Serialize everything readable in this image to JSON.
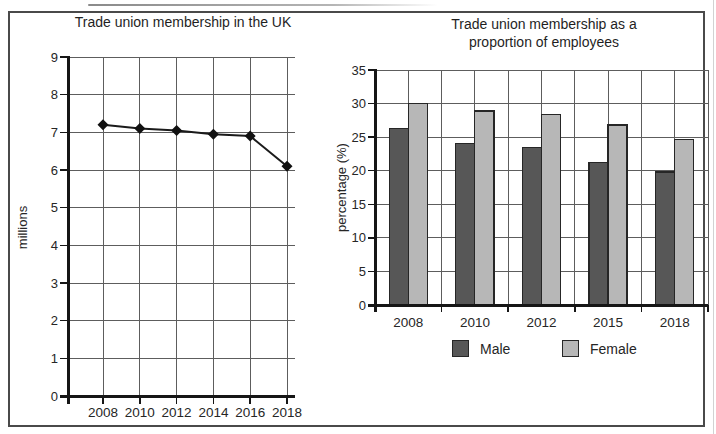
{
  "figure": {
    "kind": "scanned textbook figure with two charts",
    "frame_color": "#4a4a4a",
    "background": "#ffffff"
  },
  "styles": {
    "grid_color": "#5d5d5d",
    "axis_color": "#161616",
    "text_color": "#262626",
    "bar_edge_color": "#262626"
  },
  "chart_data": [
    {
      "type": "line",
      "title": "Trade union membership in the UK",
      "title_lines": [
        "Trade union membership in the UK"
      ],
      "xlabel": "",
      "ylabel": "millions",
      "categories": [
        "2008",
        "2010",
        "2012",
        "2014",
        "2016",
        "2018"
      ],
      "values": [
        7.2,
        7.1,
        7.05,
        6.95,
        6.9,
        6.1
      ],
      "ylim": [
        0,
        9
      ],
      "ystep": 1,
      "grid": true,
      "legend_position": "none",
      "line_color": "#1b1b1b",
      "marker": "diamond",
      "marker_color": "#111111"
    },
    {
      "type": "bar",
      "title": "Trade union membership as a proportion of employees",
      "title_lines": [
        "Trade union membership as a",
        "proportion of employees"
      ],
      "xlabel": "",
      "ylabel": "percentage (%)",
      "categories": [
        "2008",
        "2010",
        "2012",
        "2015",
        "2018"
      ],
      "series": [
        {
          "name": "Male",
          "color": "#575757",
          "values": [
            26.3,
            24.0,
            23.5,
            21.2,
            19.8
          ]
        },
        {
          "name": "Female",
          "color": "#b7b7b7",
          "values": [
            30.0,
            28.9,
            28.4,
            26.8,
            24.7
          ]
        }
      ],
      "ylim": [
        0,
        35
      ],
      "ystep": 5,
      "grid": true,
      "legend_position": "bottom"
    }
  ]
}
